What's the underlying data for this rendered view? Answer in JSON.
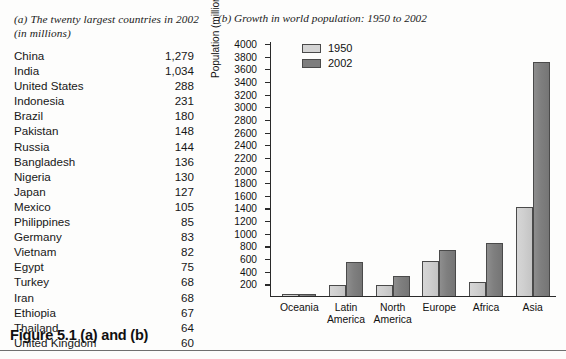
{
  "figure": {
    "caption": "Figure 5.1 (a) and (b)"
  },
  "panel_a": {
    "caption": "(a) The twenty largest countries in 2002 (in millions)",
    "columns": [
      "Country",
      "Population"
    ],
    "rows": [
      {
        "country": "China",
        "population": "1,279"
      },
      {
        "country": "India",
        "population": "1,034"
      },
      {
        "country": "United States",
        "population": "288"
      },
      {
        "country": "Indonesia",
        "population": "231"
      },
      {
        "country": "Brazil",
        "population": "180"
      },
      {
        "country": "Pakistan",
        "population": "148"
      },
      {
        "country": "Russia",
        "population": "144"
      },
      {
        "country": "Bangladesh",
        "population": "136"
      },
      {
        "country": "Nigeria",
        "population": "130"
      },
      {
        "country": "Japan",
        "population": "127"
      },
      {
        "country": "Mexico",
        "population": "105"
      },
      {
        "country": "Philippines",
        "population": "85"
      },
      {
        "country": "Germany",
        "population": "83"
      },
      {
        "country": "Vietnam",
        "population": "82"
      },
      {
        "country": "Egypt",
        "population": "75"
      },
      {
        "country": "Turkey",
        "population": "68"
      },
      {
        "country": "Iran",
        "population": "68"
      },
      {
        "country": "Ethiopia",
        "population": "67"
      },
      {
        "country": "Thailand",
        "population": "64"
      },
      {
        "country": "United Kingdom",
        "population": "60"
      }
    ]
  },
  "panel_b": {
    "caption": "(b) Growth in world population: 1950 to 2002"
  },
  "chart_data": {
    "type": "bar",
    "title": "(b) Growth in world population: 1950 to 2002",
    "xlabel": "",
    "ylabel": "Population (millions)",
    "ylim": [
      0,
      4000
    ],
    "ytick_step": 200,
    "yticks": [
      200,
      400,
      600,
      800,
      1000,
      1200,
      1400,
      1600,
      1800,
      2000,
      2200,
      2400,
      2600,
      2800,
      3000,
      3200,
      3400,
      3600,
      3800,
      4000
    ],
    "ytick_labels": [
      "200",
      "400",
      "600",
      "800",
      "1000",
      "1200",
      "1400",
      "1600",
      "1800",
      "2000",
      "2200",
      "2400",
      "2600",
      "2800",
      "3000",
      "3200",
      "3400",
      "3600",
      "3800",
      "4000"
    ],
    "grid": false,
    "legend_position": "top-left",
    "categories": [
      "Oceania",
      "Latin\nAmerica",
      "North\nAmerica",
      "Europe",
      "Africa",
      "Asia"
    ],
    "category_labels": [
      "Oceania",
      "Latin America",
      "North America",
      "Europe",
      "Africa",
      "Asia"
    ],
    "series": [
      {
        "name": "1950",
        "color": "#d4d4d4",
        "values": [
          13,
          170,
          170,
          550,
          220,
          1400
        ]
      },
      {
        "name": "2002",
        "color": "#7e7e7e",
        "values": [
          31,
          530,
          320,
          730,
          840,
          3700
        ]
      }
    ]
  }
}
